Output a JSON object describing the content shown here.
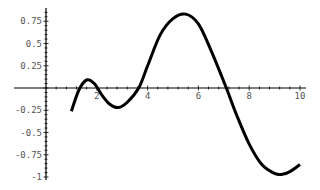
{
  "chart_data": {
    "type": "line",
    "title": "",
    "xlabel": "",
    "ylabel": "",
    "xlim": [
      0,
      10.2
    ],
    "ylim": [
      -1.0,
      0.85
    ],
    "grid": false,
    "legend": null,
    "x_ticks": [
      2,
      4,
      6,
      8,
      10
    ],
    "x_tick_labels": [
      "2",
      "4",
      "6",
      "8",
      "10"
    ],
    "y_ticks": [
      0.75,
      0.5,
      0.25,
      -0.25,
      -0.5,
      -0.75,
      -1
    ],
    "y_tick_labels": [
      "0.75",
      "0.5",
      "0.25",
      "-0.25",
      "-0.5",
      "-0.75",
      "-1"
    ],
    "series": [
      {
        "name": "curve",
        "color": "#000000",
        "x": [
          1.0,
          1.3,
          1.6,
          1.9,
          2.2,
          2.5,
          2.85,
          3.2,
          3.65,
          4.0,
          4.5,
          5.0,
          5.5,
          6.0,
          6.5,
          7.1,
          7.5,
          8.0,
          8.5,
          9.0,
          9.3,
          9.6,
          10.0
        ],
        "y": [
          -0.26,
          -0.02,
          0.09,
          0.05,
          -0.08,
          -0.18,
          -0.22,
          -0.16,
          0.0,
          0.25,
          0.6,
          0.78,
          0.83,
          0.72,
          0.42,
          0.0,
          -0.3,
          -0.63,
          -0.86,
          -0.96,
          -0.97,
          -0.94,
          -0.86
        ]
      }
    ]
  },
  "axes": {
    "x_origin_px": 46,
    "y_origin_px": 88,
    "x_px_per_unit": 25.4,
    "y_px_per_unit": 89
  }
}
